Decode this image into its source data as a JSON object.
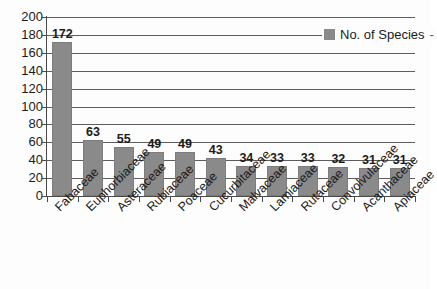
{
  "chart_data": {
    "type": "bar",
    "title": "",
    "xlabel": "",
    "ylabel": "",
    "ylim": [
      0,
      200
    ],
    "ytick_step": 20,
    "grid": true,
    "legend_position": "top-right",
    "categories": [
      "Fabaceae",
      "Euphorbiaceae",
      "Asteraceae",
      "Rubiaceae",
      "Poaceae",
      "Cucurbitaceae",
      "Malvaceae",
      "Lamiaceae",
      "Rutaceae",
      "Convolvulaceae",
      "Acanthaceae",
      "Apiaceae"
    ],
    "values": [
      172,
      63,
      55,
      49,
      49,
      43,
      34,
      33,
      33,
      32,
      31,
      31
    ],
    "series": [
      {
        "name": "No. of Species",
        "values": [
          172,
          63,
          55,
          49,
          49,
          43,
          34,
          33,
          33,
          32,
          31,
          31
        ]
      }
    ],
    "y_ticks": [
      "0",
      "20",
      "40",
      "60",
      "80",
      "100",
      "120",
      "140",
      "160",
      "180",
      "200"
    ],
    "data_labels": [
      "172",
      "63",
      "55",
      "49",
      "49",
      "43",
      "34",
      "33",
      "33",
      "32",
      "31",
      "31"
    ],
    "bar_color": "#8a8a8a",
    "gridline_color": "#5d5d5d",
    "axis_color": "#4a4a4a",
    "text_color": "#1b1b1b"
  },
  "legend": {
    "swatch_name": "legend-color-swatch",
    "label": "No. of Species",
    "trailing_tick": "-"
  }
}
